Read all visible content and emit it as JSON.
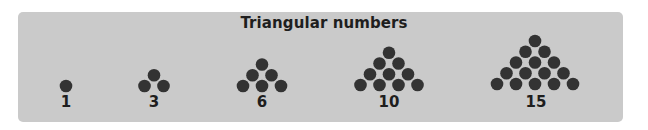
{
  "title": "Triangular numbers",
  "colors": {
    "panel_background": "#cacaca",
    "dot_fill": "#333333",
    "text": "#1e1e1e"
  },
  "figures": [
    {
      "label": "1",
      "rows": 1,
      "center_x": 66,
      "bottom_y": 86
    },
    {
      "label": "3",
      "rows": 2,
      "center_x": 154,
      "bottom_y": 86
    },
    {
      "label": "6",
      "rows": 3,
      "center_x": 262,
      "bottom_y": 86
    },
    {
      "label": "10",
      "rows": 4,
      "center_x": 389,
      "bottom_y": 85
    },
    {
      "label": "15",
      "rows": 5,
      "center_x": 535,
      "bottom_y": 84
    }
  ]
}
